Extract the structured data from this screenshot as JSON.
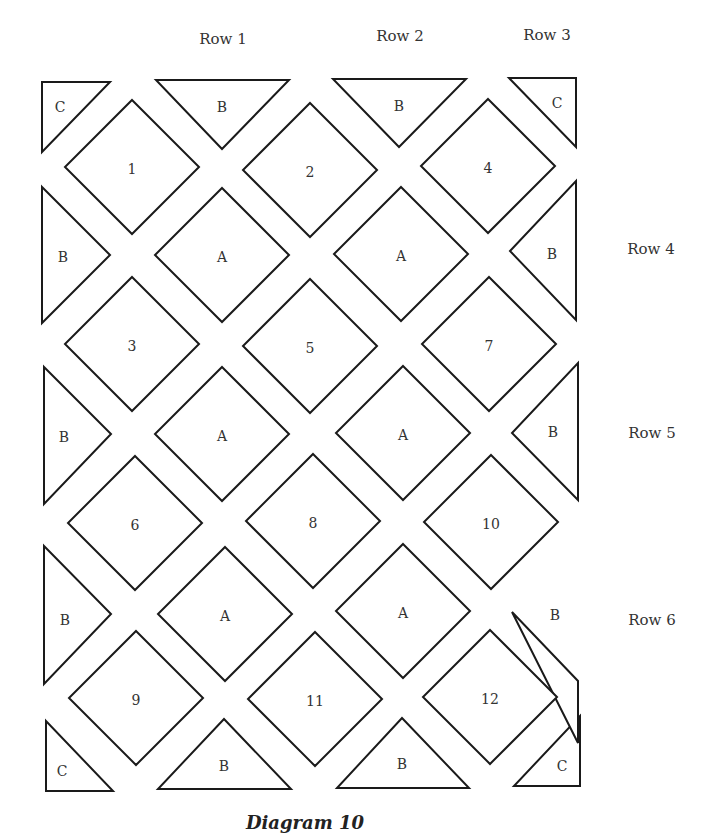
{
  "caption": "Diagram 10",
  "row_labels": [
    {
      "text": "Row 1",
      "x": 223,
      "y": 40
    },
    {
      "text": "Row 2",
      "x": 400,
      "y": 37
    },
    {
      "text": "Row 3",
      "x": 547,
      "y": 36
    },
    {
      "text": "Row 4",
      "x": 651,
      "y": 250
    },
    {
      "text": "Row 5",
      "x": 652,
      "y": 434
    },
    {
      "text": "Row 6",
      "x": 652,
      "y": 621
    }
  ],
  "colors": {
    "stroke": "#1a1a1a",
    "fill": "#ffffff",
    "text": "#333333"
  },
  "numbered_blocks": [
    {
      "label": "1",
      "cx": 132,
      "cy": 167
    },
    {
      "label": "2",
      "cx": 310,
      "cy": 170
    },
    {
      "label": "4",
      "cx": 488,
      "cy": 166
    },
    {
      "label": "3",
      "cx": 132,
      "cy": 344
    },
    {
      "label": "5",
      "cx": 310,
      "cy": 346
    },
    {
      "label": "7",
      "cx": 489,
      "cy": 344
    },
    {
      "label": "6",
      "cx": 135,
      "cy": 523
    },
    {
      "label": "8",
      "cx": 313,
      "cy": 521
    },
    {
      "label": "10",
      "cx": 491,
      "cy": 522
    },
    {
      "label": "9",
      "cx": 136,
      "cy": 698
    },
    {
      "label": "11",
      "cx": 315,
      "cy": 699
    },
    {
      "label": "12",
      "cx": 490,
      "cy": 697
    }
  ],
  "a_blocks": [
    {
      "label": "A",
      "cx": 222,
      "cy": 255
    },
    {
      "label": "A",
      "cx": 401,
      "cy": 254
    },
    {
      "label": "A",
      "cx": 222,
      "cy": 434
    },
    {
      "label": "A",
      "cx": 403,
      "cy": 433
    },
    {
      "label": "A",
      "cx": 225,
      "cy": 614
    },
    {
      "label": "A",
      "cx": 403,
      "cy": 611
    }
  ],
  "b_triangles": [
    {
      "label": "B",
      "points": "156,80 289,80 222,149",
      "lx": 222,
      "ly": 108
    },
    {
      "label": "B",
      "points": "333,79 466,79 399,147",
      "lx": 399,
      "ly": 107
    },
    {
      "label": "B",
      "points": "42,187 110,255 42,323",
      "lx": 63,
      "ly": 258
    },
    {
      "label": "B",
      "points": "576,181 576,320 510,251",
      "lx": 552,
      "ly": 255
    },
    {
      "label": "B",
      "points": "44,367 111,434 44,504",
      "lx": 64,
      "ly": 438
    },
    {
      "label": "B",
      "points": "578,363 578,500 512,433",
      "lx": 553,
      "ly": 433
    },
    {
      "label": "B",
      "points": "44,546 111,614 44,684",
      "lx": 65,
      "ly": 621
    },
    {
      "label": "B",
      "points": "578,743 578,681 512,612",
      "lx": 555,
      "ly": 616
    },
    {
      "label": "B",
      "points": "158,789 291,789 224,719",
      "lx": 224,
      "ly": 767
    },
    {
      "label": "B",
      "points": "337,788 469,788 402,718",
      "lx": 402,
      "ly": 765
    }
  ],
  "c_triangles": [
    {
      "label": "C",
      "points": "42,82 110,82 42,152",
      "lx": 60,
      "ly": 108
    },
    {
      "label": "C",
      "points": "509,78 576,78 576,147",
      "lx": 557,
      "ly": 104
    },
    {
      "label": "C",
      "points": "46,721 46,791 113,791",
      "lx": 62,
      "ly": 772
    },
    {
      "label": "C",
      "points": "514,786 580,786 580,716",
      "lx": 562,
      "ly": 767
    }
  ]
}
